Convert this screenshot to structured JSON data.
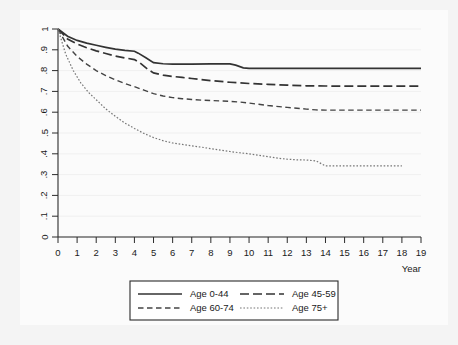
{
  "chart_data": {
    "type": "line",
    "title": "",
    "subtitle": "",
    "xlabel": "Year",
    "ylabel": "",
    "xlim": [
      0,
      19
    ],
    "ylim": [
      0,
      1
    ],
    "grid": false,
    "legend_position": "bottom",
    "x_ticks": [
      "0",
      "1",
      "2",
      "3",
      "4",
      "5",
      "6",
      "7",
      "8",
      "9",
      "10",
      "11",
      "12",
      "13",
      "14",
      "15",
      "16",
      "17",
      "18",
      "19"
    ],
    "y_ticks": [
      "0",
      ".1",
      ".2",
      ".3",
      ".4",
      ".5",
      ".6",
      ".7",
      ".8",
      ".9",
      "1"
    ],
    "series": [
      {
        "name": "Age 0-44",
        "style": "solid",
        "color": "#333333",
        "x": [
          0,
          0.5,
          1,
          1.5,
          2,
          2.5,
          3,
          3.5,
          4,
          4.2,
          4.6,
          5,
          5.5,
          6,
          7,
          8,
          9,
          9.3,
          9.7,
          10,
          11,
          12,
          13,
          14,
          15,
          16,
          17,
          18,
          19
        ],
        "y": [
          1.0,
          0.965,
          0.945,
          0.932,
          0.922,
          0.912,
          0.903,
          0.897,
          0.893,
          0.884,
          0.862,
          0.838,
          0.833,
          0.831,
          0.831,
          0.832,
          0.832,
          0.826,
          0.813,
          0.811,
          0.811,
          0.811,
          0.811,
          0.811,
          0.811,
          0.811,
          0.811,
          0.811,
          0.811
        ]
      },
      {
        "name": "Age 45-59",
        "style": "dash-long",
        "color": "#333333",
        "x": [
          0,
          0.5,
          1,
          1.5,
          2,
          2.5,
          3,
          3.5,
          4,
          4.3,
          4.7,
          5,
          5.5,
          6,
          6.5,
          7,
          7.5,
          8,
          9,
          10,
          11,
          12,
          13,
          14,
          15,
          16,
          17,
          18,
          19
        ],
        "y": [
          1.0,
          0.952,
          0.928,
          0.91,
          0.895,
          0.882,
          0.87,
          0.861,
          0.853,
          0.836,
          0.806,
          0.789,
          0.778,
          0.772,
          0.767,
          0.762,
          0.757,
          0.752,
          0.744,
          0.738,
          0.734,
          0.73,
          0.727,
          0.726,
          0.725,
          0.725,
          0.725,
          0.725,
          0.725
        ]
      },
      {
        "name": "Age 60-74",
        "style": "dash-medium",
        "color": "#444444",
        "x": [
          0,
          0.5,
          1,
          1.5,
          2,
          2.5,
          3,
          3.5,
          4,
          4.5,
          5,
          5.5,
          6,
          6.5,
          7,
          7.5,
          8,
          8.5,
          9,
          9.5,
          10,
          10.5,
          11,
          12,
          13,
          13.5,
          14,
          15,
          16,
          17,
          18,
          19
        ],
        "y": [
          1.0,
          0.918,
          0.868,
          0.831,
          0.8,
          0.776,
          0.756,
          0.738,
          0.723,
          0.706,
          0.689,
          0.678,
          0.67,
          0.665,
          0.661,
          0.658,
          0.656,
          0.654,
          0.652,
          0.649,
          0.644,
          0.638,
          0.632,
          0.623,
          0.615,
          0.611,
          0.61,
          0.61,
          0.61,
          0.61,
          0.61,
          0.61
        ]
      },
      {
        "name": "Age 75+",
        "style": "dotted",
        "color": "#777777",
        "x": [
          0,
          0.4,
          0.8,
          1.2,
          1.6,
          2,
          2.5,
          3,
          3.5,
          4,
          4.5,
          5,
          5.5,
          6,
          6.5,
          7,
          7.5,
          8,
          8.5,
          9,
          9.5,
          10,
          10.5,
          11,
          11.5,
          12,
          12.5,
          13,
          13.5,
          14,
          15,
          16,
          17,
          18
        ],
        "y": [
          1.0,
          0.88,
          0.8,
          0.74,
          0.695,
          0.66,
          0.616,
          0.58,
          0.548,
          0.522,
          0.498,
          0.478,
          0.463,
          0.452,
          0.445,
          0.438,
          0.432,
          0.425,
          0.418,
          0.411,
          0.405,
          0.4,
          0.393,
          0.386,
          0.379,
          0.374,
          0.371,
          0.37,
          0.366,
          0.342,
          0.342,
          0.342,
          0.342,
          0.342
        ]
      }
    ]
  },
  "legend": {
    "entries": [
      {
        "label": "Age 0-44",
        "style": "solid"
      },
      {
        "label": "Age 45-59",
        "style": "dash-long"
      },
      {
        "label": "Age 60-74",
        "style": "dash-medium"
      },
      {
        "label": "Age 75+",
        "style": "dotted"
      }
    ]
  },
  "axes": {
    "x_title": "Year"
  }
}
